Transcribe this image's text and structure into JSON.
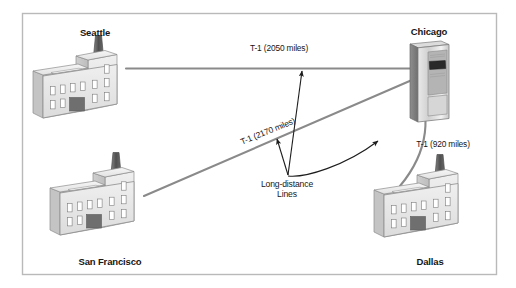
{
  "figure": {
    "type": "network-topology-diagram",
    "frame": {
      "border_color": "#b9b9b9",
      "background": "#ffffff"
    },
    "line_color": "#8a8a8a",
    "leader_color": "#1d1d1d",
    "text_color": "#161616"
  },
  "nodes": [
    {
      "id": "seattle",
      "label": "Seattle",
      "icon": "office-building-icon",
      "kind": "building",
      "label_x": 95,
      "label_y": 28
    },
    {
      "id": "chicago",
      "label": "Chicago",
      "icon": "server-tower-icon",
      "kind": "server",
      "label_x": 429,
      "label_y": 27
    },
    {
      "id": "san-francisco",
      "label": "San Francisco",
      "icon": "office-building-icon",
      "kind": "building",
      "label_x": 110,
      "label_y": 258
    },
    {
      "id": "dallas",
      "label": "Dallas",
      "icon": "office-building-icon",
      "kind": "building",
      "label_x": 430,
      "label_y": 258
    }
  ],
  "links": [
    {
      "id": "seattle-chicago",
      "from": "seattle",
      "to": "chicago",
      "label": "T-1 (2050 miles)",
      "shape": "straight",
      "label_x": 279,
      "label_y": 45,
      "rotation": 0
    },
    {
      "id": "sanfrancisco-chicago",
      "from": "san-francisco",
      "to": "chicago",
      "label": "T-1 (2170 miles)",
      "shape": "straight",
      "label_x": 268,
      "label_y": 132,
      "rotation": -22
    },
    {
      "id": "chicago-dallas",
      "from": "chicago",
      "to": "dallas",
      "label": "T-1 (920 miles)",
      "shape": "curved",
      "label_x": 442,
      "label_y": 146,
      "rotation": 0
    }
  ],
  "callout": {
    "id": "long-distance-lines",
    "line1": "Long-distance",
    "line2": "Lines",
    "label_x": 287,
    "label_y": 184,
    "arrow_origin": {
      "x": 288,
      "y": 176
    },
    "arrow_targets": [
      {
        "x": 301,
        "y": 69
      },
      {
        "x": 275,
        "y": 137
      },
      {
        "x": 381,
        "y": 139
      }
    ]
  }
}
